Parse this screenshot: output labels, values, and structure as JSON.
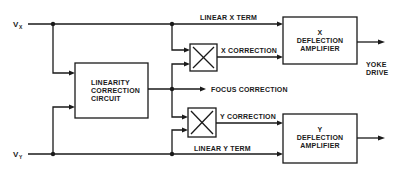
{
  "diagram": {
    "inputs": {
      "vx": {
        "main": "V",
        "sub": "X"
      },
      "vy": {
        "main": "V",
        "sub": "Y"
      }
    },
    "blocks": {
      "linearity": {
        "lines": [
          "LINEARITY",
          "CORRECTION",
          "CIRCUIT"
        ]
      },
      "x_amp": {
        "lines": [
          "X",
          "DEFLECTION",
          "AMPLIFIER"
        ]
      },
      "y_amp": {
        "lines": [
          "Y",
          "DEFLECTION",
          "AMPLIFIER"
        ]
      },
      "x_multiplier": {
        "symbol": "multiplier"
      },
      "y_multiplier": {
        "symbol": "multiplier"
      }
    },
    "signals": {
      "linear_x": "LINEAR X TERM",
      "x_correction": "X CORRECTION",
      "focus_correction": "FOCUS CORRECTION",
      "y_correction": "Y CORRECTION",
      "linear_y": "LINEAR Y TERM"
    },
    "outputs": {
      "yoke_drive": [
        "YOKE",
        "DRIVE"
      ]
    }
  }
}
